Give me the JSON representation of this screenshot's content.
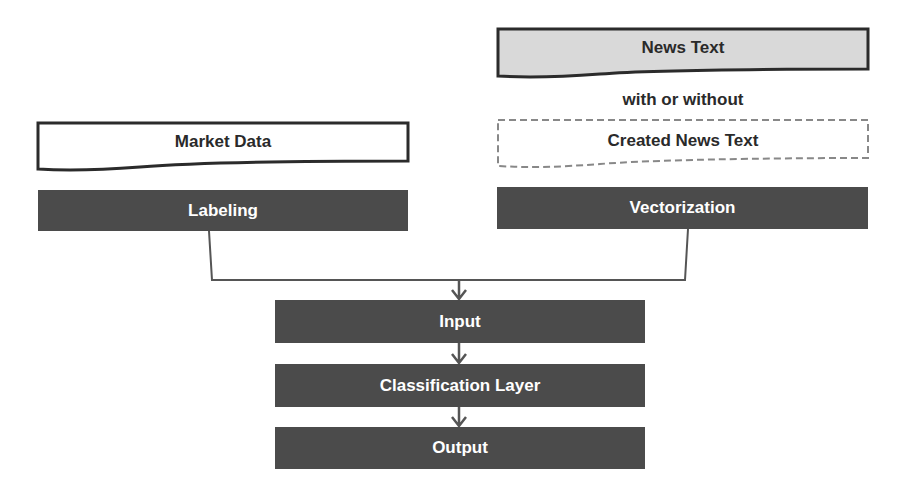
{
  "diagram": {
    "news_text": "News Text",
    "with_or_without": "with or without",
    "created_news_text": "Created News Text",
    "market_data": "Market Data",
    "labeling": "Labeling",
    "vectorization": "Vectorization",
    "input": "Input",
    "classification_layer": "Classification Layer",
    "output": "Output"
  },
  "colors": {
    "dark_box": "#4b4b4b",
    "news_fill": "#d9d9d9",
    "stroke": "#333333",
    "dashed": "#888888"
  }
}
